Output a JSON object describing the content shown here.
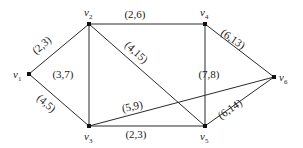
{
  "diagram": {
    "type": "weighted-undirected-graph",
    "nodes": [
      {
        "id": "v1",
        "name": "v",
        "sub": "1",
        "x": 29,
        "y": 74,
        "lx": 13,
        "ly": 78
      },
      {
        "id": "v2",
        "name": "v",
        "sub": "2",
        "x": 89,
        "y": 24,
        "lx": 84,
        "ly": 16
      },
      {
        "id": "v3",
        "name": "v",
        "sub": "3",
        "x": 89,
        "y": 126,
        "lx": 84,
        "ly": 140
      },
      {
        "id": "v4",
        "name": "v",
        "sub": "4",
        "x": 205,
        "y": 24,
        "lx": 200,
        "ly": 16
      },
      {
        "id": "v5",
        "name": "v",
        "sub": "5",
        "x": 205,
        "y": 126,
        "lx": 200,
        "ly": 140
      },
      {
        "id": "v6",
        "name": "v",
        "sub": "6",
        "x": 274,
        "y": 77,
        "lx": 279,
        "ly": 81
      }
    ],
    "edges": [
      {
        "from": "v1",
        "to": "v2",
        "label": "(2,3)",
        "lx": 44,
        "ly": 48,
        "rot": -40
      },
      {
        "from": "v1",
        "to": "v3",
        "label": "(4,5)",
        "lx": 44,
        "ly": 106,
        "rot": 40
      },
      {
        "from": "v2",
        "to": "v3",
        "label": "(3,7)",
        "lx": 63,
        "ly": 78,
        "rot": 0
      },
      {
        "from": "v2",
        "to": "v4",
        "label": "(2,6)",
        "lx": 135,
        "ly": 18,
        "rot": 0
      },
      {
        "from": "v2",
        "to": "v5",
        "label": "(4,15)",
        "lx": 134,
        "ly": 55,
        "rot": 42
      },
      {
        "from": "v3",
        "to": "v5",
        "label": "(2,3)",
        "lx": 136,
        "ly": 138,
        "rot": 0
      },
      {
        "from": "v3",
        "to": "v6",
        "label": "(5,9)",
        "lx": 133,
        "ly": 110,
        "rot": -12
      },
      {
        "from": "v4",
        "to": "v5",
        "label": "(7,8)",
        "lx": 209,
        "ly": 78,
        "rot": 0
      },
      {
        "from": "v4",
        "to": "v6",
        "label": "(6,13)",
        "lx": 231,
        "ly": 42,
        "rot": 35
      },
      {
        "from": "v5",
        "to": "v6",
        "label": "(6,14)",
        "lx": 232,
        "ly": 112,
        "rot": -35
      }
    ]
  }
}
